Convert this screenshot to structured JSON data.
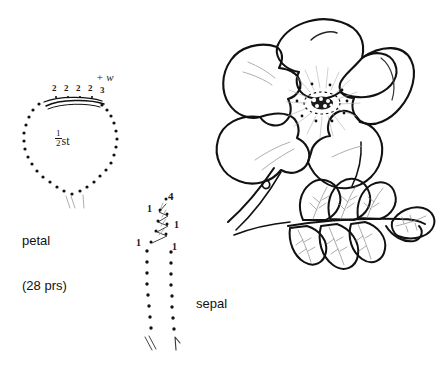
{
  "page": {
    "background_color": "#ffffff",
    "ink_color": "#111111"
  },
  "petal_chart": {
    "name": "petal-chart",
    "label": "petal",
    "count_label": "(28 prs)",
    "center_text_fraction_numerator": "1",
    "center_text_fraction_denominator": "2",
    "center_text_suffix": "st",
    "annotation": "+ w",
    "top_row_numbers": [
      "2",
      "2",
      "2",
      "2",
      "3"
    ],
    "shape": "teardrop-dotted-outline",
    "bead_dot_count": 34
  },
  "sepal_chart": {
    "name": "sepal-chart",
    "label": "sepal",
    "numbers": {
      "top": "4",
      "upper_left": "1",
      "right": "1",
      "lower_left": "1",
      "lower_right": "1"
    },
    "shape": "two-dotted-columns-with-zigzag-top"
  },
  "illustration": {
    "flower": {
      "name": "wild-rose-flower",
      "petal_count": 5,
      "center": "stamen-cluster"
    },
    "leaf_sprig": {
      "name": "compound-leaf-sprig",
      "leaflet_count": 7
    },
    "stem": {
      "name": "thorned-stem",
      "thorn_count": 1
    }
  },
  "colors": {
    "ink": "#111111",
    "vein": "#8a8a8a",
    "stamen": "#b0b0b0",
    "background": "#ffffff"
  }
}
